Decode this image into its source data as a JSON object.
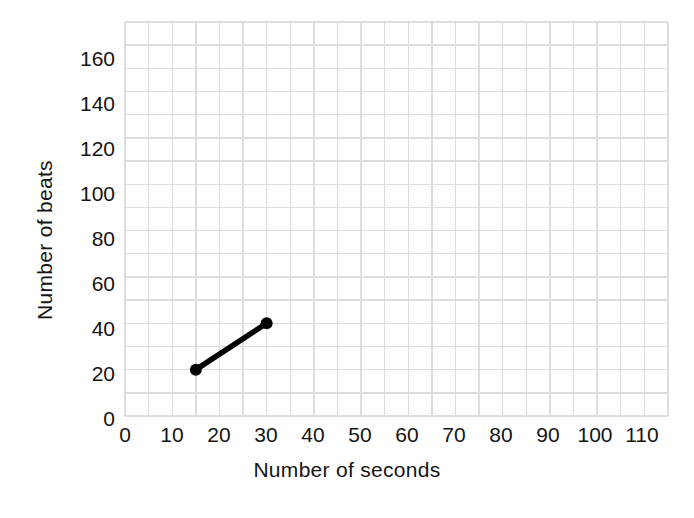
{
  "chart_data": {
    "type": "line",
    "title": "",
    "subtitle": "",
    "xlabel": "Number of seconds",
    "ylabel": "Number of beats",
    "xlim": [
      0,
      115
    ],
    "ylim": [
      0,
      170
    ],
    "x_ticks": [
      0,
      10,
      20,
      30,
      40,
      50,
      60,
      70,
      80,
      90,
      100,
      110
    ],
    "y_ticks": [
      0,
      20,
      40,
      60,
      80,
      100,
      120,
      140,
      160
    ],
    "x_minor_step": 5,
    "y_minor_step": 10,
    "grid": true,
    "grid_color": "#dddddd",
    "legend": false,
    "legend_position": "none",
    "series": [
      {
        "name": "heartbeats",
        "color": "#000000",
        "marker": "circle",
        "x": [
          15,
          30
        ],
        "y": [
          20,
          40
        ],
        "points": [
          {
            "x": 15,
            "y": 20
          },
          {
            "x": 30,
            "y": 40
          }
        ]
      }
    ],
    "annotations": []
  },
  "axes": {
    "x_title": "Number of seconds",
    "y_title": "Number of beats",
    "x_tick_labels": [
      "0",
      "10",
      "20",
      "30",
      "40",
      "50",
      "60",
      "70",
      "80",
      "90",
      "100",
      "110"
    ],
    "y_tick_labels": [
      "0",
      "20",
      "40",
      "60",
      "80",
      "100",
      "120",
      "140",
      "160"
    ]
  }
}
